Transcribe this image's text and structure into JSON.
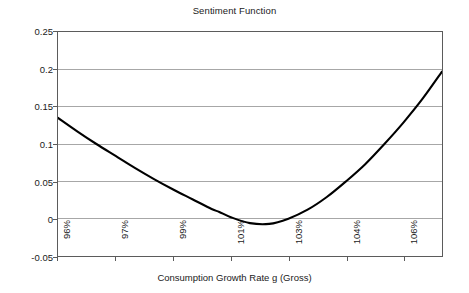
{
  "chart_data": {
    "type": "line",
    "title": "Sentiment Function",
    "xlabel": "Consumption Growth Rate g (Gross)",
    "ylabel": "",
    "grid": true,
    "legend": false,
    "xlim": [
      96,
      106
    ],
    "ylim": [
      -0.05,
      0.25
    ],
    "x_tick_labels": [
      "96%",
      "97%",
      "99%",
      "101%",
      "103%",
      "104%",
      "106%"
    ],
    "x_tick_values": [
      96,
      97.5,
      99,
      100.5,
      102,
      103.5,
      105
    ],
    "y_tick_labels": [
      "0.25",
      "0.2",
      "0.15",
      "0.1",
      "0.05",
      "0",
      "-0.05"
    ],
    "y_tick_values": [
      0.25,
      0.2,
      0.15,
      0.1,
      0.05,
      0,
      -0.05
    ],
    "series": [
      {
        "name": "Sentiment",
        "color": "#000000",
        "x": [
          96.0,
          96.5,
          97.0,
          97.5,
          98.0,
          98.5,
          99.0,
          99.5,
          100.0,
          100.2,
          100.5,
          101.0,
          101.5,
          102.0,
          102.5,
          103.0,
          103.5,
          104.0,
          104.5,
          105.0,
          105.5,
          106.0
        ],
        "values": [
          0.135,
          0.117,
          0.1,
          0.084,
          0.068,
          0.053,
          0.039,
          0.026,
          0.013,
          0.009,
          0.002,
          -0.006,
          -0.007,
          0.0,
          0.012,
          0.029,
          0.05,
          0.073,
          0.1,
          0.129,
          0.161,
          0.197
        ]
      }
    ]
  },
  "axes": {
    "y_labels": [
      "0.25",
      "0.2",
      "0.15",
      "0.1",
      "0.05",
      "0",
      "-0.05"
    ],
    "x_labels": [
      "96%",
      "97%",
      "99%",
      "101%",
      "103%",
      "104%",
      "106%"
    ]
  },
  "colors": {
    "curve": "#000000",
    "gridline": "#a6a6a6",
    "frame": "#5b5b5b",
    "background": "#ffffff",
    "text": "#1a1a1a"
  }
}
